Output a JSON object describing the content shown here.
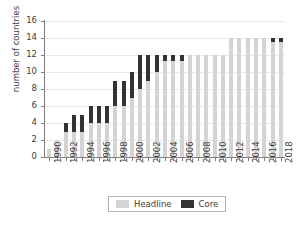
{
  "chart_data": {
    "type": "bar",
    "stacked": true,
    "title": "",
    "xlabel": "",
    "ylabel": "number of countries",
    "ylim": [
      0,
      16
    ],
    "ytick_step": 2,
    "yticks": [
      0,
      2,
      4,
      6,
      8,
      10,
      12,
      14,
      16
    ],
    "grid": true,
    "grid_axis": "y",
    "legend_position": "bottom",
    "categories": [
      "1990",
      "1991",
      "1992",
      "1993",
      "1994",
      "1995",
      "1996",
      "1997",
      "1998",
      "1999",
      "2000",
      "2001",
      "2002",
      "2003",
      "2004",
      "2005",
      "2006",
      "2007",
      "2008",
      "2009",
      "2010",
      "2011",
      "2012",
      "2013",
      "2014",
      "2015",
      "2016",
      "2017",
      "2018"
    ],
    "xtick_labels": [
      "1990",
      "1992",
      "1994",
      "1996",
      "1998",
      "2000",
      "2002",
      "2004",
      "2006",
      "2008",
      "2010",
      "2012",
      "2014",
      "2016",
      "2018"
    ],
    "series": [
      {
        "name": "Headline",
        "color": "#d4d4d4",
        "values": [
          1,
          2,
          3,
          3,
          3,
          4,
          4,
          4,
          6,
          6,
          7,
          8,
          9,
          10,
          11.3,
          11.3,
          11.3,
          12,
          12,
          12,
          12,
          12,
          14,
          14,
          14,
          14,
          14,
          13.5,
          13.5
        ]
      },
      {
        "name": "Core",
        "color": "#333333",
        "values": [
          0,
          0,
          1,
          2,
          2,
          2,
          2,
          2,
          3,
          3,
          3,
          4,
          3,
          2,
          0.7,
          0.7,
          0.7,
          0,
          0,
          0,
          0,
          0,
          0,
          0,
          0,
          0,
          0,
          0.5,
          0.5
        ]
      }
    ],
    "totals": [
      1,
      2,
      4,
      5,
      5,
      6,
      6,
      6,
      9,
      9,
      10,
      12,
      12,
      12,
      12,
      12,
      12,
      12,
      12,
      12,
      12,
      12,
      14,
      14,
      14,
      14,
      14,
      14,
      14
    ]
  },
  "legend": {
    "items": [
      {
        "label": "Headline",
        "color": "#d4d4d4"
      },
      {
        "label": "Core",
        "color": "#333333"
      }
    ]
  },
  "colors": {
    "headline": "#d4d4d4",
    "core": "#333333",
    "axis": "#7d7d7d",
    "grid": "#e9e9e9",
    "text": "#3d3d3d",
    "background": "#ffffff"
  }
}
